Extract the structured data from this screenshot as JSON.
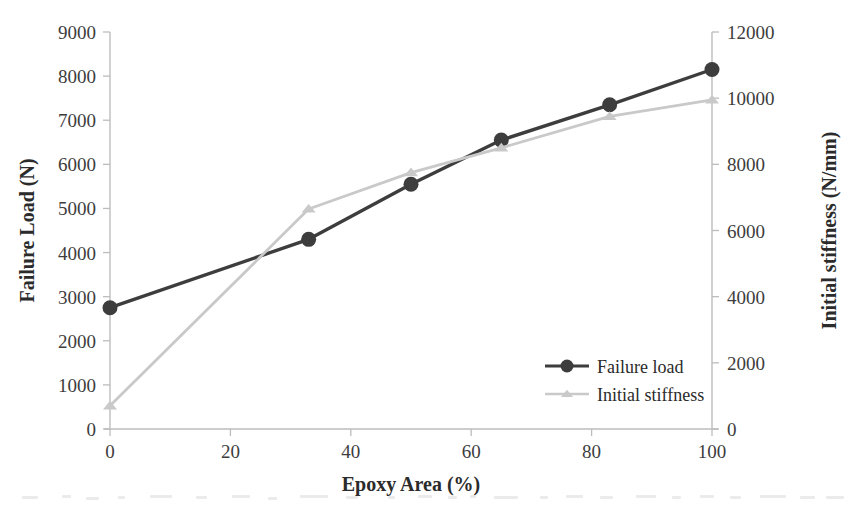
{
  "chart_data": {
    "type": "line",
    "title": "",
    "xlabel": "Epoxy Area (%)",
    "ylabel": "Failure Load (N)",
    "y2label": "Initial stiffness (N/mm)",
    "xlim": [
      0,
      100
    ],
    "ylim": [
      0,
      9000
    ],
    "y2lim": [
      0,
      12000
    ],
    "xticks": [
      0,
      20,
      40,
      60,
      80,
      100
    ],
    "yticks": [
      0,
      1000,
      2000,
      3000,
      4000,
      5000,
      6000,
      7000,
      8000,
      9000
    ],
    "y2ticks": [
      0,
      2000,
      4000,
      6000,
      8000,
      10000,
      12000
    ],
    "xtick_labels": [
      "0",
      "20",
      "40",
      "60",
      "80",
      "100"
    ],
    "ytick_labels": [
      "0",
      "1000",
      "2000",
      "3000",
      "4000",
      "5000",
      "6000",
      "7000",
      "8000",
      "9000"
    ],
    "y2tick_labels": [
      "0",
      "2000",
      "4000",
      "6000",
      "8000",
      "10000",
      "12000"
    ],
    "grid": false,
    "legend_position": "inside-lower-right",
    "series": [
      {
        "name": "Failure load",
        "axis": "left",
        "marker": "circle",
        "color": "#3d3d3d",
        "x": [
          0,
          33,
          50,
          65,
          83,
          100
        ],
        "values": [
          2750,
          4300,
          5550,
          6550,
          7350,
          8150
        ]
      },
      {
        "name": "Initial stiffness",
        "axis": "right",
        "marker": "triangle",
        "color": "#c9c9c9",
        "x": [
          0,
          33,
          50,
          65,
          83,
          100
        ],
        "values": [
          700,
          6650,
          7750,
          8500,
          9450,
          9950
        ]
      }
    ]
  },
  "axes": {
    "x_title": "Epoxy Area (%)",
    "y_left_title": "Failure Load (N)",
    "y_right_title": "Initial stiffness (N/mm)"
  },
  "legend": {
    "entries": [
      {
        "label": "Failure load"
      },
      {
        "label": "Initial stiffness"
      }
    ]
  },
  "colors": {
    "failure_load": "#3d3d3d",
    "initial_stiffness": "#c9c9c9",
    "axis": "#bdbdbd",
    "text": "#2b2b2b",
    "background": "#ffffff"
  }
}
